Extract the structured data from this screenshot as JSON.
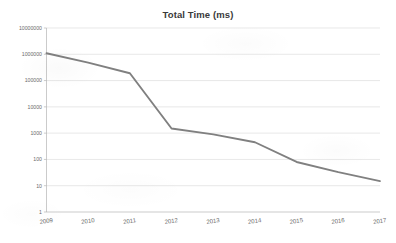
{
  "chart_data": {
    "type": "line",
    "title": "Total Time (ms)",
    "xlabel": "",
    "ylabel": "",
    "yscale": "log",
    "ylim": [
      1,
      10000000
    ],
    "grid": true,
    "legend": false,
    "line_color": "#808080",
    "categories": [
      "2009",
      "2010",
      "2011",
      "2012",
      "2013",
      "2014",
      "2015",
      "2016",
      "2017"
    ],
    "ytick_labels": [
      "1",
      "10",
      "100",
      "1000",
      "10000",
      "100000",
      "1000000",
      "10000000"
    ],
    "ytick_values": [
      1,
      10,
      100,
      1000,
      10000,
      100000,
      1000000,
      10000000
    ],
    "series": [
      {
        "name": "Total Time (ms)",
        "values": [
          1100000,
          480000,
          190000,
          1500,
          900,
          450,
          80,
          33,
          15
        ]
      }
    ]
  }
}
